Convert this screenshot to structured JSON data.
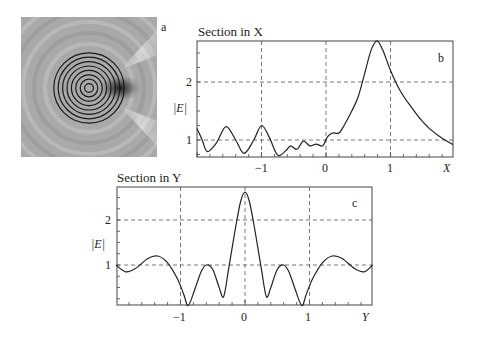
{
  "panel_a": {
    "label": "a",
    "description": "Grayscale field intensity map with concentric ring structure (8 rings) and focal spot at right edge of rings"
  },
  "chart_data": [
    {
      "type": "line",
      "panel": "b",
      "title": "Section in X",
      "xlabel": "X",
      "ylabel": "|E|",
      "xlim": [
        -2.0,
        1.97
      ],
      "ylim": [
        0.71,
        2.71
      ],
      "xticks": [
        -1,
        0,
        1
      ],
      "xtick_labels": [
        "−1",
        "0",
        "1"
      ],
      "yticks": [
        1,
        2
      ],
      "ytick_labels": [
        "1",
        "2"
      ],
      "grid": "dashed at labeled ticks",
      "series": [
        {
          "name": "|E| along X",
          "x": [
            -2.0,
            -1.92,
            -1.84,
            -1.7,
            -1.55,
            -1.4,
            -1.27,
            -1.12,
            -1.0,
            -0.88,
            -0.75,
            -0.62,
            -0.55,
            -0.45,
            -0.35,
            -0.25,
            -0.15,
            -0.05,
            0.02,
            0.1,
            0.2,
            0.28,
            0.4,
            0.5,
            0.6,
            0.7,
            0.79,
            0.88,
            1.0,
            1.15,
            1.3,
            1.45,
            1.6,
            1.8,
            1.97
          ],
          "values": [
            1.2,
            1.0,
            0.8,
            0.95,
            1.23,
            1.0,
            0.77,
            1.0,
            1.25,
            1.05,
            0.74,
            0.82,
            0.9,
            0.84,
            0.98,
            0.9,
            0.93,
            0.9,
            1.05,
            1.12,
            1.12,
            1.25,
            1.5,
            1.75,
            2.15,
            2.55,
            2.71,
            2.55,
            2.2,
            1.85,
            1.6,
            1.38,
            1.2,
            1.03,
            0.92
          ]
        }
      ]
    },
    {
      "type": "line",
      "panel": "c",
      "title": "Section in Y",
      "xlabel": "Y",
      "ylabel": "|E|",
      "xlim": [
        -2.0,
        1.98
      ],
      "ylim": [
        0.11,
        2.62
      ],
      "xticks": [
        -1,
        0,
        1
      ],
      "xtick_labels": [
        "−1",
        "0",
        "1"
      ],
      "yticks": [
        1,
        2
      ],
      "ytick_labels": [
        "1",
        "2"
      ],
      "grid": "dashed at labeled ticks",
      "series": [
        {
          "name": "|E| along Y",
          "x": [
            -2.0,
            -1.85,
            -1.7,
            -1.5,
            -1.35,
            -1.2,
            -1.05,
            -0.95,
            -0.88,
            -0.78,
            -0.68,
            -0.6,
            -0.5,
            -0.4,
            -0.33,
            -0.25,
            -0.15,
            -0.07,
            0.0,
            0.07,
            0.15,
            0.25,
            0.33,
            0.4,
            0.5,
            0.6,
            0.68,
            0.78,
            0.88,
            0.95,
            1.05,
            1.2,
            1.35,
            1.5,
            1.7,
            1.85,
            1.98
          ],
          "values": [
            1.0,
            0.85,
            0.92,
            1.15,
            1.2,
            1.05,
            0.7,
            0.35,
            0.1,
            0.45,
            0.85,
            1.0,
            0.9,
            0.5,
            0.3,
            0.95,
            1.8,
            2.4,
            2.62,
            2.4,
            1.8,
            0.95,
            0.3,
            0.5,
            0.9,
            1.0,
            0.85,
            0.45,
            0.1,
            0.35,
            0.7,
            1.05,
            1.2,
            1.15,
            0.92,
            0.85,
            1.0
          ]
        }
      ]
    }
  ],
  "labels": {
    "b_title": "Section in X",
    "b_panel": "b",
    "b_ylabel": "|E|",
    "b_xlabel": "X",
    "c_title": "Section in Y",
    "c_panel": "c",
    "c_ylabel": "|E|",
    "c_xlabel": "Y",
    "tick_m1": "−1",
    "tick_0": "0",
    "tick_1": "1",
    "tick_2": "2"
  }
}
